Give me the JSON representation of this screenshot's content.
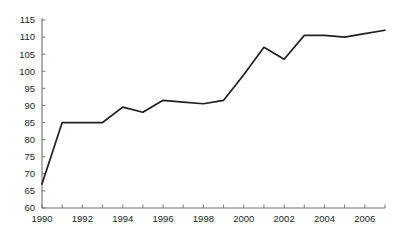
{
  "chart_data": {
    "type": "line",
    "title": "",
    "subtitle": "",
    "xlabel": "",
    "ylabel": "",
    "xlim": [
      1990,
      2007
    ],
    "ylim": [
      60,
      115
    ],
    "grid": false,
    "legend": "none",
    "series": [
      {
        "name": "",
        "color": "#231f20",
        "x": [
          1990,
          1991,
          1992,
          1993,
          1994,
          1995,
          1996,
          1997,
          1998,
          1999,
          2000,
          2001,
          2002,
          2003,
          2004,
          2005,
          2006,
          2007
        ],
        "values": [
          67,
          85,
          85,
          85,
          89.5,
          88,
          91.5,
          91,
          90.5,
          91.5,
          99,
          107,
          103.5,
          110.5,
          110.5,
          110,
          111,
          112
        ]
      }
    ],
    "y_ticks": [
      60,
      65,
      70,
      75,
      80,
      85,
      90,
      95,
      100,
      105,
      110,
      115
    ],
    "y_tick_labels": [
      "60",
      "65",
      "70",
      "75",
      "80",
      "85",
      "90",
      "95",
      "100",
      "105",
      "110",
      "115"
    ],
    "x_ticks": [
      1990,
      1991,
      1992,
      1993,
      1994,
      1995,
      1996,
      1997,
      1998,
      1999,
      2000,
      2001,
      2002,
      2003,
      2004,
      2005,
      2006,
      2007
    ],
    "x_tick_labels_shown": [
      "1990",
      "1992",
      "1994",
      "1996",
      "1998",
      "2000",
      "2002",
      "2004",
      "2006"
    ],
    "x_labeled_ticks": [
      1990,
      1992,
      1994,
      1996,
      1998,
      2000,
      2002,
      2004,
      2006
    ],
    "axis_color": "#6e6e6e",
    "line_color": "#231f20",
    "background_color": "#ffffff"
  }
}
